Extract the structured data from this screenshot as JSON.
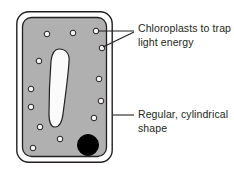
{
  "diagram": {
    "background_color": "#ffffff",
    "line_color": "#231f20",
    "cytoplasm_color": "#b0b0b0",
    "cell_wall_color": "#ffffff",
    "vacuole_color": "#fbfbfb",
    "nucleus_color": "#000000",
    "chloroplast_fill": "#f5f5f5",
    "text_color": "#231f20"
  },
  "labels": {
    "chloroplasts": "Chloroplasts to trap light energy",
    "shape": "Regular, cylindrical shape"
  },
  "parts": {
    "cell_wall": "cell-wall",
    "cytoplasm": "cytoplasm",
    "vacuole": "vacuole",
    "nucleus": "nucleus",
    "chloroplast": "chloroplast"
  },
  "chart_data": {
    "type": "diagram",
    "cell": {
      "x": 16,
      "y": 11,
      "width": 97,
      "height": 152,
      "corner_radius": 12
    },
    "cytoplasm": {
      "x": 22,
      "y": 17,
      "width": 85,
      "height": 140,
      "corner_radius": 9
    },
    "vacuole": {
      "center_x": 59,
      "center_y": 88,
      "width": 22,
      "height": 78
    },
    "nucleus": {
      "center_x": 88,
      "center_y": 145,
      "radius": 10.5
    },
    "chloroplasts": [
      {
        "cx": 47,
        "cy": 34,
        "r": 2.8
      },
      {
        "cx": 73,
        "cy": 33,
        "r": 2.8
      },
      {
        "cx": 96,
        "cy": 31,
        "r": 2.8
      },
      {
        "cx": 102,
        "cy": 48,
        "r": 2.8
      },
      {
        "cx": 39,
        "cy": 61,
        "r": 2.8
      },
      {
        "cx": 99,
        "cy": 79,
        "r": 2.8
      },
      {
        "cx": 31,
        "cy": 89,
        "r": 2.8
      },
      {
        "cx": 101,
        "cy": 101,
        "r": 2.8
      },
      {
        "cx": 31,
        "cy": 107,
        "r": 2.8
      },
      {
        "cx": 94,
        "cy": 118,
        "r": 2.8
      },
      {
        "cx": 40,
        "cy": 127,
        "r": 2.8
      },
      {
        "cx": 60,
        "cy": 139,
        "r": 2.8
      },
      {
        "cx": 33,
        "cy": 148,
        "r": 2.8
      }
    ],
    "leader_lines": [
      {
        "name": "chloroplast-leader-upper",
        "points": "96,31 134,31"
      },
      {
        "name": "chloroplast-leader-lower",
        "points": "102,48 134,32"
      },
      {
        "name": "shape-leader",
        "points": "113,115 134,115"
      }
    ],
    "annotations": [
      {
        "text": "Chloroplasts to trap light energy",
        "x": 138,
        "y": 22
      },
      {
        "text": "Regular, cylindrical shape",
        "x": 138,
        "y": 108
      }
    ]
  }
}
